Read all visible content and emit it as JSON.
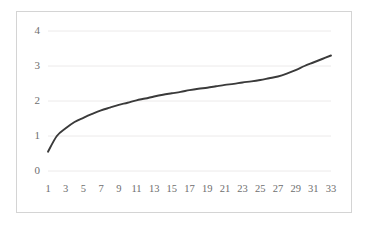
{
  "chart_data": {
    "type": "line",
    "title": "",
    "subtitle": "",
    "xlabel": "",
    "ylabel": "",
    "xlim": [
      1,
      33
    ],
    "ylim": [
      0,
      4
    ],
    "grid": true,
    "legend": "none",
    "y_ticks": [
      "0",
      "1",
      "2",
      "3",
      "4"
    ],
    "y_tick_values": [
      0,
      1,
      2,
      3,
      4
    ],
    "x_ticks": [
      "1",
      "3",
      "5",
      "7",
      "9",
      "11",
      "13",
      "15",
      "17",
      "19",
      "21",
      "23",
      "25",
      "27",
      "29",
      "31",
      "33"
    ],
    "x_tick_values": [
      1,
      3,
      5,
      7,
      9,
      11,
      13,
      15,
      17,
      19,
      21,
      23,
      25,
      27,
      29,
      31,
      33
    ],
    "series": [
      {
        "name": "series-1",
        "color": "#3a3a3a",
        "x": [
          1,
          2,
          3,
          4,
          5,
          6,
          7,
          8,
          9,
          10,
          11,
          12,
          13,
          14,
          15,
          16,
          17,
          18,
          19,
          20,
          21,
          22,
          23,
          24,
          25,
          26,
          27,
          28,
          29,
          30,
          31,
          32,
          33
        ],
        "values": [
          0.55,
          1.0,
          1.22,
          1.4,
          1.52,
          1.63,
          1.73,
          1.81,
          1.89,
          1.95,
          2.02,
          2.07,
          2.13,
          2.18,
          2.22,
          2.26,
          2.31,
          2.35,
          2.38,
          2.42,
          2.46,
          2.49,
          2.53,
          2.56,
          2.6,
          2.65,
          2.7,
          2.78,
          2.88,
          3.0,
          3.1,
          3.2,
          3.3
        ]
      }
    ],
    "colors": {
      "line": "#3a3a3a",
      "grid": "#eceaea",
      "frame": "#d4d4d4",
      "tick_text": "#6e6e6e",
      "background": "#ffffff"
    },
    "geometry": {
      "plot_left": 48,
      "plot_right": 331,
      "plot_top": 31,
      "plot_bottom": 171
    }
  }
}
